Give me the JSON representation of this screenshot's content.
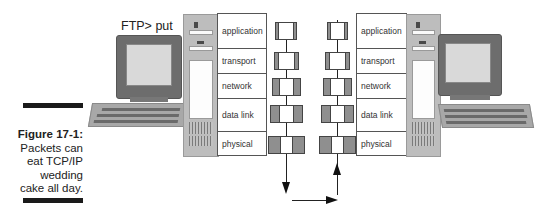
{
  "caption": {
    "figure_label": "Figure 17-1:",
    "text_lines": [
      "Packets can",
      "eat TCP/IP",
      "wedding",
      "cake all day."
    ]
  },
  "sender": {
    "command": "FTP> put",
    "layers": [
      "application",
      "transport",
      "network",
      "data link",
      "physical"
    ]
  },
  "receiver": {
    "layers": [
      "application",
      "transport",
      "network",
      "data link",
      "physical"
    ]
  },
  "packets": {
    "sender_stack": [
      {
        "layer": "application",
        "header_left": 2,
        "header_right": 2,
        "width": 22
      },
      {
        "layer": "transport",
        "header_left": 4,
        "header_right": 4,
        "width": 24
      },
      {
        "layer": "network",
        "header_left": 6,
        "header_right": 6,
        "width": 28
      },
      {
        "layer": "data link",
        "header_left": 8,
        "header_right": 8,
        "width": 32
      },
      {
        "layer": "physical",
        "header_left": 10,
        "header_right": 10,
        "width": 36
      }
    ],
    "receiver_stack": [
      {
        "layer": "application",
        "header_left": 2,
        "header_right": 2,
        "width": 22
      },
      {
        "layer": "transport",
        "header_left": 4,
        "header_right": 4,
        "width": 24
      },
      {
        "layer": "network",
        "header_left": 6,
        "header_right": 6,
        "width": 28
      },
      {
        "layer": "data link",
        "header_left": 8,
        "header_right": 8,
        "width": 32
      },
      {
        "layer": "physical",
        "header_left": 10,
        "header_right": 10,
        "width": 36
      }
    ]
  },
  "flow": {
    "sender_direction": "down",
    "transfer_direction": "right",
    "receiver_direction": "up"
  },
  "colors": {
    "header_gray": "#8f8f8f",
    "monitor_gray": "#6d6d6d",
    "screen": "#d9d9d9",
    "tower": "#bdbdbd",
    "rule": "#1a1a1a"
  }
}
